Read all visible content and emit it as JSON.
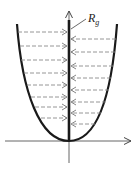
{
  "diagram": {
    "label_main": "R",
    "label_sub": "g",
    "colors": {
      "curve": "#1a1a1a",
      "axis": "#555555",
      "arrow": "#8a8a8a",
      "axis_thick": "#1a1a1a"
    },
    "axes": {
      "origin": [
        69,
        141
      ],
      "x_start": 5,
      "x_end": 132,
      "y_top": 10,
      "y_bottom": 163
    },
    "left_arrows": [
      {
        "y": 32,
        "x0": 18
      },
      {
        "y": 46,
        "x0": 20
      },
      {
        "y": 60,
        "x0": 21
      },
      {
        "y": 73,
        "x0": 24
      },
      {
        "y": 85,
        "x0": 27
      },
      {
        "y": 97,
        "x0": 31
      },
      {
        "y": 107,
        "x0": 35
      },
      {
        "y": 118,
        "x0": 41
      }
    ],
    "right_arrows": [
      {
        "y": 39,
        "x0": 116
      },
      {
        "y": 52,
        "x0": 115
      },
      {
        "y": 66,
        "x0": 113
      },
      {
        "y": 78,
        "x0": 111
      },
      {
        "y": 90,
        "x0": 109
      },
      {
        "y": 102,
        "x0": 106
      },
      {
        "y": 113,
        "x0": 101
      },
      {
        "y": 124,
        "x0": 95
      }
    ]
  }
}
